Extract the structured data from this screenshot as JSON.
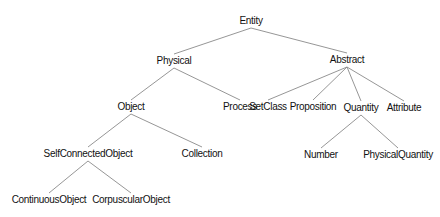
{
  "diagram": {
    "type": "tree",
    "edge_color": "#8a8a8a",
    "nodes": [
      {
        "id": "entity",
        "label": "Entity",
        "x": 251,
        "y": 21
      },
      {
        "id": "physical",
        "label": "Physical",
        "x": 174,
        "y": 61
      },
      {
        "id": "abstract",
        "label": "Abstract",
        "x": 347,
        "y": 60
      },
      {
        "id": "object",
        "label": "Object",
        "x": 131,
        "y": 107
      },
      {
        "id": "process",
        "label": "Process",
        "x": 240,
        "y": 107
      },
      {
        "id": "setclass",
        "label": "SetClass",
        "x": 268,
        "y": 107
      },
      {
        "id": "proposition",
        "label": "Proposition",
        "x": 313,
        "y": 107
      },
      {
        "id": "quantity",
        "label": "Quantity",
        "x": 361,
        "y": 108
      },
      {
        "id": "attribute",
        "label": "Attribute",
        "x": 404,
        "y": 108
      },
      {
        "id": "selfconnectedobject",
        "label": "SelfConnectedObject",
        "x": 88,
        "y": 154
      },
      {
        "id": "collection",
        "label": "Collection",
        "x": 202,
        "y": 154
      },
      {
        "id": "number",
        "label": "Number",
        "x": 321,
        "y": 155
      },
      {
        "id": "physicalquantity",
        "label": "PhysicalQuantity",
        "x": 398,
        "y": 155
      },
      {
        "id": "continuousobject",
        "label": "ContinuousObject",
        "x": 49,
        "y": 200
      },
      {
        "id": "corpuscularobject",
        "label": "CorpuscularObject",
        "x": 131,
        "y": 200
      }
    ],
    "edges": [
      [
        "entity",
        "physical"
      ],
      [
        "entity",
        "abstract"
      ],
      [
        "physical",
        "object"
      ],
      [
        "physical",
        "process"
      ],
      [
        "abstract",
        "setclass"
      ],
      [
        "abstract",
        "proposition"
      ],
      [
        "abstract",
        "quantity"
      ],
      [
        "abstract",
        "attribute"
      ],
      [
        "object",
        "selfconnectedobject"
      ],
      [
        "object",
        "collection"
      ],
      [
        "quantity",
        "number"
      ],
      [
        "quantity",
        "physicalquantity"
      ],
      [
        "selfconnectedobject",
        "continuousobject"
      ],
      [
        "selfconnectedobject",
        "corpuscularobject"
      ]
    ]
  }
}
